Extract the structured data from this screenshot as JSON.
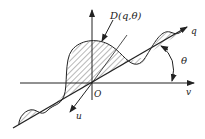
{
  "diagram": {
    "type": "axes-with-oscillating-curve",
    "labels": {
      "curve": "D(q,θ)",
      "origin": "O",
      "q_axis": "q",
      "v_axis": "v",
      "u_axis": "u",
      "angle": "θ"
    },
    "colors": {
      "stroke": "#222222",
      "background": "#ffffff"
    }
  }
}
